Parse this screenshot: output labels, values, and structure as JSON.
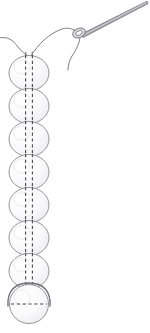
{
  "canvas": {
    "width": 150,
    "height": 333,
    "background": "#ffffff",
    "title": "Needle and thread strung through a vertical column of beads"
  },
  "style": {
    "outline_color": "#8a8a8f",
    "outline_soft_color": "#b4b4ba",
    "dash_color": "#4a4a52",
    "thread_color": "#6e6e76",
    "needle_color": "#6a6a72",
    "needle_fill": "#d9d9de",
    "bead_fill": "#fbfbfc",
    "bead_shade": "#f0f0f2",
    "outline_width": 0.9,
    "thread_width": 0.9,
    "dash_width": 1.1,
    "dash_pattern": "3.2 2.6"
  },
  "needle": {
    "label": "sewing-needle",
    "tip_x": 147,
    "tip_y": 2,
    "eye_x": 79,
    "eye_y": 33,
    "eye_rx": 5.2,
    "eye_ry": 3.4,
    "eye_rotation_deg": -24,
    "shaft_width": 2.2
  },
  "thread": {
    "label": "thread",
    "left_tail_path": "M -2 38 C 8 36 13 40 18 47 C 22 52 25 54 28 56",
    "over_arc_path": "M 31 56 C 38 44 50 33 62 29 C 68 27 74 29 77 32",
    "loop_tail_path": "M 80 36 C 80 43 76 50 72 56 C 69 61 68 66 68 70",
    "through_eye_path": "M 74 30 C 77 31 80 33 82 35",
    "bead_entry_left": "M 26 52 C 26 57 26 60 26 63",
    "bead_entry_right": "M 32 52 C 32 57 32 60 32 63"
  },
  "beads": {
    "label": "bead-column",
    "count": 7,
    "center_x": 29,
    "rx": 20,
    "ry": 17.5,
    "items": [
      {
        "name": "bead-1",
        "cy": 73,
        "hole_type": "vertical"
      },
      {
        "name": "bead-2",
        "cy": 106,
        "hole_type": "vertical"
      },
      {
        "name": "bead-3",
        "cy": 139,
        "hole_type": "vertical"
      },
      {
        "name": "bead-4",
        "cy": 172,
        "hole_type": "vertical"
      },
      {
        "name": "bead-5",
        "cy": 205,
        "hole_type": "vertical"
      },
      {
        "name": "bead-6",
        "cy": 238,
        "hole_type": "vertical"
      },
      {
        "name": "bead-7",
        "cy": 271,
        "hole_type": "vertical"
      }
    ],
    "hole_dash_left_dx": -3.4,
    "hole_dash_right_dx": 3.4,
    "hole_dash_half_height": 18
  },
  "stop_bead": {
    "label": "stop-bead",
    "name": "bottom-stop-bead",
    "cx": 29,
    "cy": 304,
    "r": 19.5,
    "hole_type": "horizontal",
    "hole_dash_half_width": 18,
    "arc_path": "M 8 306 C 7 292 14 283 29 283 C 44 283 51 292 50 306",
    "arc_description": "thread loop arcing over the sideways stop bead"
  },
  "alt_text": {
    "summary": "Line drawing: a threaded sewing needle at upper right, its thread curving down into a vertical stack of seven round beads strung through their vertical holes, ending at a bottom bead turned sideways with a horizontal hole and a loop of thread arcing over it."
  }
}
